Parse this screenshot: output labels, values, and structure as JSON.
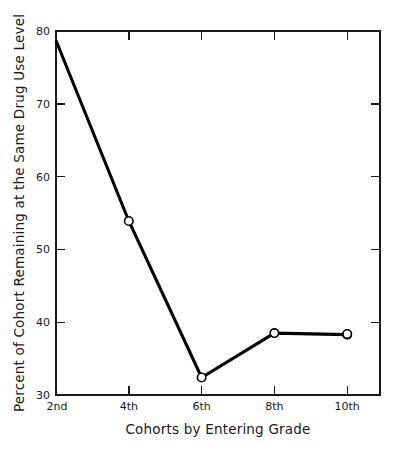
{
  "chart_data": {
    "type": "line",
    "title": "",
    "xlabel": "Cohorts by Entering Grade",
    "ylabel": "Percent of Cohort Remaining at the Same Drug Use Level",
    "categories": [
      "2nd",
      "4th",
      "6th",
      "8th",
      "10th"
    ],
    "values": [
      78.7,
      53.9,
      32.4,
      38.5,
      38.3
    ],
    "series": [
      {
        "name": "Percent remaining at same drug use level",
        "values": [
          78.7,
          53.9,
          32.4,
          38.5,
          38.3
        ]
      }
    ],
    "xtick_labels": [
      "2nd",
      "4th",
      "6th",
      "8th",
      "10th"
    ],
    "ytick_labels": [
      "30",
      "40",
      "50",
      "60",
      "70",
      "80"
    ],
    "yticks": [
      30,
      40,
      50,
      60,
      70,
      80
    ],
    "ylim": [
      30,
      80
    ],
    "xlim": [
      0,
      5.5
    ],
    "grid": false,
    "legend": false,
    "legend_position": "none",
    "marker": "open-circle",
    "line_color": "#000000",
    "marker_fill": "#ffffff",
    "background_color": "#ffffff",
    "frame": true,
    "tick_direction": "in"
  },
  "figure": {
    "background_color": "#ffffff",
    "bottom_caption_ghost": ""
  }
}
